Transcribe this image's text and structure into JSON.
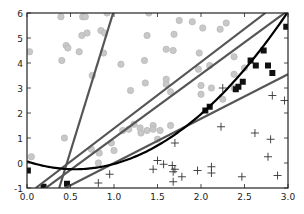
{
  "chart_data": {
    "type": "scatter",
    "title": "",
    "xlabel": "",
    "ylabel": "",
    "xlim": [
      0.0,
      3.0
    ],
    "ylim": [
      -1,
      6
    ],
    "grid": false,
    "legend": null,
    "x_ticks": [
      "0.0",
      "0.5",
      "1.0",
      "1.5",
      "2.0",
      "2.5",
      "3.0"
    ],
    "y_ticks": [
      "-1",
      "0",
      "1",
      "2",
      "3",
      "4",
      "5",
      "6"
    ],
    "colors": {
      "circle": "#c8c8c8",
      "circle_edge": "#b4b4b4",
      "square": "#111111",
      "plus": "#333333",
      "gray_line": "#555555",
      "curve": "#000000",
      "axes": "#222222"
    },
    "series": [
      {
        "name": "circles",
        "marker": "circle",
        "points": [
          [
            0.39,
            5.85
          ],
          [
            0.64,
            5.85
          ],
          [
            0.67,
            5.85
          ],
          [
            0.92,
            6.0
          ],
          [
            1.4,
            6.0
          ],
          [
            1.75,
            5.7
          ],
          [
            0.03,
            4.45
          ],
          [
            0.45,
            4.7
          ],
          [
            0.47,
            4.6
          ],
          [
            0.6,
            4.45
          ],
          [
            0.4,
            4.1
          ],
          [
            0.63,
            5.1
          ],
          [
            0.69,
            5.2
          ],
          [
            0.85,
            5.3
          ],
          [
            0.89,
            5.2
          ],
          [
            0.88,
            4.4
          ],
          [
            0.75,
            3.5
          ],
          [
            1.08,
            3.95
          ],
          [
            1.35,
            4.1
          ],
          [
            1.38,
            5.1
          ],
          [
            1.36,
            3.2
          ],
          [
            1.19,
            2.9
          ],
          [
            1.6,
            4.55
          ],
          [
            1.6,
            3.35
          ],
          [
            1.6,
            3.15
          ],
          [
            1.65,
            2.85
          ],
          [
            1.69,
            5.15
          ],
          [
            1.9,
            5.65
          ],
          [
            2.02,
            5.4
          ],
          [
            2.29,
            5.6
          ],
          [
            2.22,
            5.35
          ],
          [
            1.68,
            4.5
          ],
          [
            1.98,
            4.4
          ],
          [
            2.1,
            3.9
          ],
          [
            2.38,
            4.25
          ],
          [
            2.38,
            3.55
          ],
          [
            2.5,
            3.8
          ],
          [
            2.0,
            3.1
          ],
          [
            1.97,
            3.75
          ],
          [
            2.12,
            3.0
          ],
          [
            2.38,
            3.0
          ],
          [
            2.25,
            2.55
          ],
          [
            2.0,
            2.75
          ],
          [
            0.43,
            1.0
          ],
          [
            0.05,
            0.25
          ],
          [
            0.74,
            0.55
          ],
          [
            0.83,
            0.4
          ],
          [
            0.82,
            0.0
          ],
          [
            1.1,
            1.3
          ],
          [
            1.17,
            1.35
          ],
          [
            1.23,
            1.55
          ],
          [
            1.3,
            1.4
          ],
          [
            1.31,
            1.2
          ],
          [
            1.38,
            1.3
          ],
          [
            1.45,
            1.5
          ],
          [
            1.45,
            1.35
          ],
          [
            1.53,
            1.3
          ],
          [
            1.65,
            1.5
          ],
          [
            1.0,
            0.5
          ],
          [
            0.97,
            0.8
          ],
          [
            1.5,
            0.95
          ]
        ]
      },
      {
        "name": "squares",
        "marker": "square",
        "points": [
          [
            0.01,
            -0.3
          ],
          [
            0.19,
            -0.95
          ],
          [
            0.46,
            -0.83
          ],
          [
            2.05,
            2.1
          ],
          [
            2.1,
            2.25
          ],
          [
            2.4,
            2.95
          ],
          [
            2.43,
            3.05
          ],
          [
            2.48,
            3.25
          ],
          [
            2.57,
            4.1
          ],
          [
            2.63,
            3.9
          ],
          [
            2.72,
            4.5
          ],
          [
            2.77,
            3.9
          ],
          [
            2.82,
            3.6
          ],
          [
            2.98,
            5.45
          ]
        ]
      },
      {
        "name": "plus",
        "marker": "plus",
        "points": [
          [
            0.82,
            -0.8
          ],
          [
            0.95,
            -0.45
          ],
          [
            1.5,
            0.1
          ],
          [
            1.57,
            -0.05
          ],
          [
            1.45,
            -0.25
          ],
          [
            1.68,
            -0.35
          ],
          [
            1.67,
            -0.1
          ],
          [
            1.7,
            -0.25
          ],
          [
            1.78,
            -0.55
          ],
          [
            1.68,
            -0.75
          ],
          [
            1.96,
            -0.3
          ],
          [
            2.12,
            -0.15
          ],
          [
            2.12,
            -0.4
          ],
          [
            1.7,
            0.8
          ],
          [
            2.25,
            3.0
          ],
          [
            2.23,
            1.45
          ],
          [
            2.47,
            -0.55
          ],
          [
            2.62,
            1.2
          ],
          [
            2.8,
            0.95
          ],
          [
            2.77,
            0.25
          ],
          [
            2.88,
            -0.5
          ],
          [
            2.96,
            2.5
          ],
          [
            2.82,
            2.7
          ]
        ]
      }
    ],
    "lines": [
      {
        "name": "steep-line",
        "color": "gray",
        "x": [
          0.37,
          0.99
        ],
        "y": [
          -1,
          6
        ]
      },
      {
        "name": "upper-line",
        "color": "gray",
        "x": [
          0.1,
          2.74
        ],
        "y": [
          -1,
          6
        ]
      },
      {
        "name": "middle-line",
        "color": "gray",
        "x": [
          0.0,
          3.0
        ],
        "y": [
          -1.55,
          6.1
        ]
      },
      {
        "name": "lower-line",
        "color": "gray",
        "x": [
          0.44,
          3.0
        ],
        "y": [
          -1,
          3.55
        ]
      }
    ],
    "curve": {
      "name": "quadratic-boundary",
      "color": "black",
      "type": "parabola",
      "vertex": [
        0.55,
        -0.25
      ],
      "x": [
        0.0,
        0.25,
        0.55,
        1.0,
        1.5,
        2.0,
        2.5,
        3.0
      ],
      "y": [
        0.03,
        -0.15,
        -0.25,
        -0.03,
        0.65,
        1.85,
        3.6,
        6.05
      ]
    }
  }
}
